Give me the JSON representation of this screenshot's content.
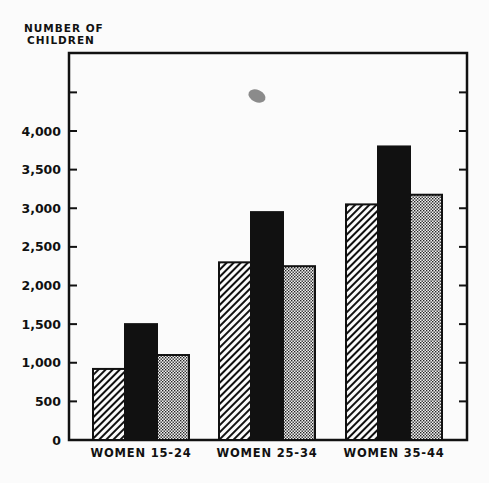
{
  "chart_data": {
    "type": "bar",
    "title": "",
    "ylabel": "NUMBER OF CHILDREN",
    "xlabel": "",
    "categories": [
      "WOMEN 15-24",
      "WOMEN 25-34",
      "WOMEN 35-44"
    ],
    "series": [
      {
        "name": "Series 1 (diagonal hatch)",
        "pattern": "hatch",
        "values": [
          920,
          2300,
          3050
        ]
      },
      {
        "name": "Series 2 (solid black)",
        "pattern": "solid",
        "values": [
          1500,
          2950,
          3800
        ]
      },
      {
        "name": "Series 3 (dotted)",
        "pattern": "dots",
        "values": [
          1100,
          2250,
          3175
        ]
      }
    ],
    "yticks": [
      0,
      500,
      1000,
      1500,
      2000,
      2500,
      3000,
      3500,
      4000,
      4500
    ],
    "ytick_labels": [
      "0",
      "500",
      "1,000",
      "1,500",
      "2,000",
      "2,500",
      "3,000",
      "3,500",
      "4,000",
      ""
    ],
    "ylim": [
      0,
      5000
    ],
    "grid": false,
    "legend": null
  },
  "ylabel_lines": [
    "NUMBER OF",
    "CHILDREN"
  ],
  "colors": {
    "ink": "#111111",
    "background": "#fbfbfb",
    "smudge": "#777777"
  }
}
